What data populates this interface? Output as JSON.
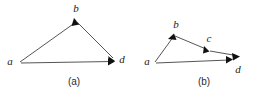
{
  "figure": {
    "background_color": "#ffffff",
    "line_color": "#555555",
    "arrow_color": "#111111",
    "label_color": "#1a1a1a"
  },
  "panels": [
    {
      "id": "panel-a",
      "caption": "(a)",
      "caption_pos": {
        "x": 74,
        "y": 84
      },
      "vertices": [
        {
          "name": "a",
          "label": "a",
          "x": 20,
          "y": 62,
          "label_x": 10,
          "label_y": 64
        },
        {
          "name": "b",
          "label": "b",
          "x": 74,
          "y": 19,
          "label_x": 74,
          "label_y": 12
        },
        {
          "name": "d",
          "label": "d",
          "x": 114,
          "y": 60,
          "label_x": 119,
          "label_y": 62
        }
      ],
      "edges": [
        {
          "name": "edge-a-b",
          "from": "a",
          "to": "b",
          "x1": 20,
          "y1": 62,
          "x2": 74,
          "y2": 19,
          "arrow": true
        },
        {
          "name": "edge-b-d",
          "from": "b",
          "to": "d",
          "x1": 76,
          "y1": 21,
          "x2": 113,
          "y2": 59,
          "arrow": true
        },
        {
          "name": "edge-a-d",
          "from": "a",
          "to": "d",
          "x1": 21,
          "y1": 63,
          "x2": 112,
          "y2": 61,
          "arrow": true
        }
      ]
    },
    {
      "id": "panel-b",
      "caption": "(b)",
      "caption_pos": {
        "x": 204,
        "y": 84
      },
      "vertices": [
        {
          "name": "a",
          "label": "a",
          "x": 155,
          "y": 62,
          "label_x": 147,
          "label_y": 64
        },
        {
          "name": "b",
          "label": "b",
          "x": 173,
          "y": 36,
          "label_x": 175,
          "label_y": 28
        },
        {
          "name": "c",
          "label": "c",
          "x": 208,
          "y": 51,
          "label_x": 208,
          "label_y": 42
        },
        {
          "name": "d",
          "label": "d",
          "x": 237,
          "y": 57,
          "label_x": 237,
          "label_y": 72
        }
      ],
      "edges": [
        {
          "name": "edge-a-b",
          "from": "a",
          "to": "b",
          "x1": 155,
          "y1": 62,
          "x2": 172,
          "y2": 37,
          "arrow": true
        },
        {
          "name": "edge-b-c",
          "from": "b",
          "to": "c",
          "x1": 175,
          "y1": 36,
          "x2": 207,
          "y2": 50,
          "arrow": true
        },
        {
          "name": "edge-c-d",
          "from": "c",
          "to": "d",
          "x1": 209,
          "y1": 51,
          "x2": 239,
          "y2": 56,
          "arrow": true
        },
        {
          "name": "edge-a-d",
          "from": "a",
          "to": "d",
          "x1": 156,
          "y1": 63,
          "x2": 232,
          "y2": 59,
          "arrow": true
        }
      ]
    }
  ]
}
